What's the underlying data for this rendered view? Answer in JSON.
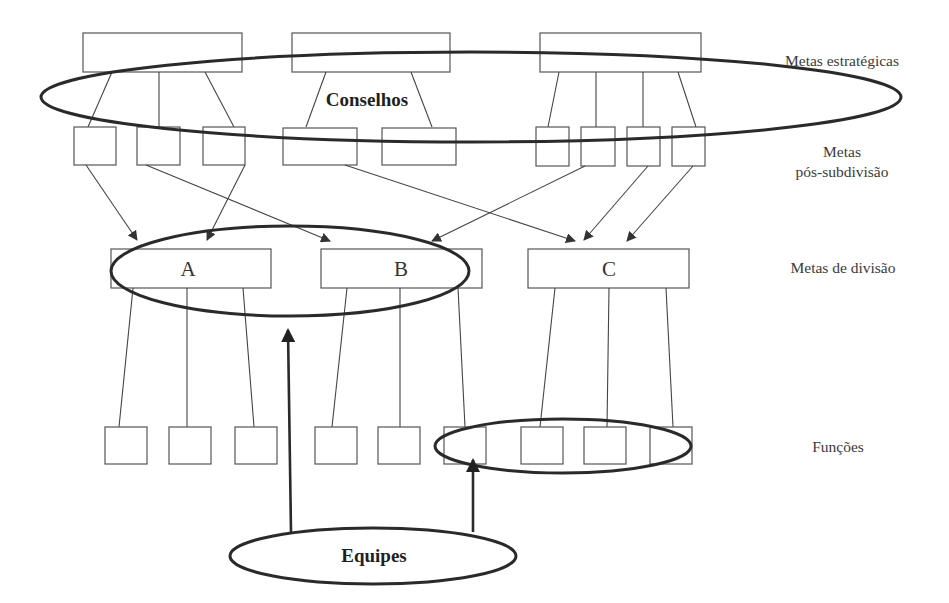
{
  "diagram": {
    "type": "organizational goal cascade",
    "levels": [
      {
        "id": "strategic",
        "label": "Metas estratégicas"
      },
      {
        "id": "post_subdivision",
        "label_line1": "Metas",
        "label_line2": "pós-subdivisão"
      },
      {
        "id": "division",
        "label": "Metas de divisão"
      },
      {
        "id": "functions",
        "label": "Funções"
      }
    ],
    "division_boxes": [
      {
        "id": "A",
        "label": "A"
      },
      {
        "id": "B",
        "label": "B"
      },
      {
        "id": "C",
        "label": "C"
      }
    ],
    "groupings": {
      "councils": {
        "label": "Conselhos"
      },
      "teams": {
        "label": "Equipes"
      }
    },
    "counts": {
      "strategic_goals": 3,
      "post_subdivision_goals": 9,
      "division_goals": 3,
      "functions": 9
    }
  }
}
